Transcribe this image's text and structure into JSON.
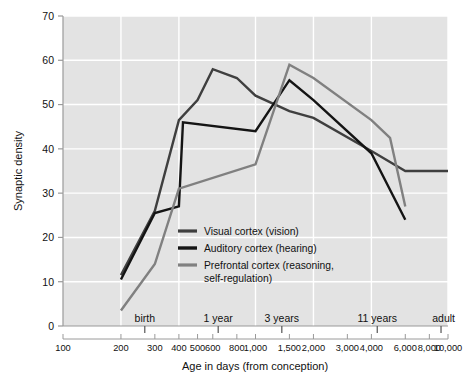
{
  "chart_data": {
    "type": "line",
    "title": "",
    "xlabel": "Age in days (from conception)",
    "ylabel": "Synaptic density",
    "xscale": "log",
    "xlim": [
      100,
      10000
    ],
    "ylim": [
      0,
      70
    ],
    "grid": true,
    "legend_position": "center",
    "y_ticks": [
      0,
      10,
      20,
      30,
      40,
      50,
      60,
      70
    ],
    "y_tick_labels": [
      "0",
      "10",
      "20",
      "30",
      "40",
      "50",
      "60",
      "70"
    ],
    "x_ticks": [
      100,
      200,
      300,
      400,
      500,
      600,
      800,
      1000,
      1500,
      2000,
      3000,
      4000,
      6000,
      8000,
      10000
    ],
    "x_tick_labels": [
      "100",
      "200",
      "300",
      "400",
      "500",
      "600",
      "800",
      "1,000",
      "1,500",
      "2,000",
      "3,000",
      "4,000",
      "6,000",
      "8,000",
      "10,000"
    ],
    "stage_markers": [
      {
        "label": "birth",
        "x": 266
      },
      {
        "label": "1 year",
        "x": 640
      },
      {
        "label": "3 years",
        "x": 1370
      },
      {
        "label": "11 years",
        "x": 4290
      },
      {
        "label": "adult",
        "x": 9200
      }
    ],
    "series": [
      {
        "name": "Visual cortex (vision)",
        "color": "#3f3f3f",
        "points": [
          {
            "x": 200,
            "y": 11.5
          },
          {
            "x": 300,
            "y": 26.0
          },
          {
            "x": 400,
            "y": 46.5
          },
          {
            "x": 500,
            "y": 51.0
          },
          {
            "x": 600,
            "y": 58.0
          },
          {
            "x": 800,
            "y": 56.0
          },
          {
            "x": 1000,
            "y": 52.0
          },
          {
            "x": 1500,
            "y": 48.5
          },
          {
            "x": 2000,
            "y": 47.0
          },
          {
            "x": 4000,
            "y": 39.5
          },
          {
            "x": 6000,
            "y": 35.0
          },
          {
            "x": 10000,
            "y": 35.0
          }
        ]
      },
      {
        "name": "Auditory cortex (hearing)",
        "color": "#141414",
        "points": [
          {
            "x": 200,
            "y": 10.5
          },
          {
            "x": 300,
            "y": 25.5
          },
          {
            "x": 400,
            "y": 27.0
          },
          {
            "x": 420,
            "y": 46.0
          },
          {
            "x": 1000,
            "y": 44.0
          },
          {
            "x": 1500,
            "y": 55.5
          },
          {
            "x": 2000,
            "y": 51.0
          },
          {
            "x": 4000,
            "y": 39.0
          },
          {
            "x": 6000,
            "y": 24.0
          }
        ]
      },
      {
        "name": "Prefrontal cortex (reasoning, self-regulation)",
        "color": "#808080",
        "points": [
          {
            "x": 200,
            "y": 3.5
          },
          {
            "x": 300,
            "y": 14.0
          },
          {
            "x": 400,
            "y": 31.0
          },
          {
            "x": 1000,
            "y": 36.5
          },
          {
            "x": 1500,
            "y": 59.0
          },
          {
            "x": 2000,
            "y": 56.0
          },
          {
            "x": 4000,
            "y": 46.5
          },
          {
            "x": 5000,
            "y": 42.5
          },
          {
            "x": 6000,
            "y": 27.0
          }
        ]
      }
    ]
  },
  "legend": {
    "items": [
      {
        "label": "Visual cortex (vision)",
        "color": "#3f3f3f"
      },
      {
        "label": "Auditory cortex (hearing)",
        "color": "#141414"
      },
      {
        "label": "Prefrontal cortex (reasoning,",
        "label2": "self-regulation)",
        "color": "#808080"
      }
    ]
  },
  "style": {
    "plot_background": "#e3e3e3",
    "gridline_color": "#ffffff",
    "axis_color": "#9a9a9a",
    "text_color": "#111111"
  }
}
